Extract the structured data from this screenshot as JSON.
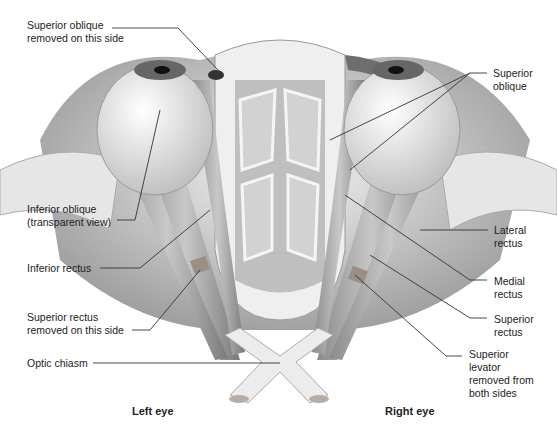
{
  "labels": {
    "superior_oblique_removed": "Superior oblique\nremoved on this side",
    "inferior_oblique": "Inferior oblique\n(transparent view)",
    "inferior_rectus": "Inferior rectus",
    "superior_rectus_removed": "Superior rectus\nremoved on this side",
    "optic_chiasm": "Optic chiasm",
    "superior_oblique": "Superior\noblique",
    "lateral_rectus": "Lateral\nrectus",
    "medial_rectus": "Medial\nrectus",
    "superior_rectus": "Superior\nrectus",
    "superior_levator": "Superior\nlevator\nremoved from\nboth sides"
  },
  "captions": {
    "left_eye": "Left eye",
    "right_eye": "Right eye"
  }
}
